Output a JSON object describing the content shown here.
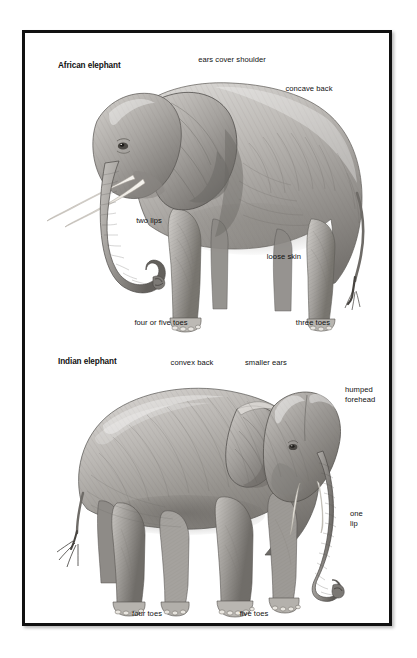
{
  "figure": {
    "kind": "comparative-anatomy-plate",
    "background_color": "#ffffff",
    "frame_color": "#111111",
    "ink_color": "#111111"
  },
  "panels": [
    {
      "id": "african",
      "title": "African elephant",
      "orientation": "facing left, full side profile",
      "labels": [
        {
          "text": "ears cover shoulder",
          "align": "center"
        },
        {
          "text": "concave back",
          "align": "center"
        },
        {
          "text": "two lips",
          "align": "center"
        },
        {
          "text": "loose skin",
          "align": "center"
        },
        {
          "text": "four or five toes",
          "align": "center"
        },
        {
          "text": "three toes",
          "align": "center"
        }
      ]
    },
    {
      "id": "indian",
      "title": "Indian elephant",
      "orientation": "facing right, three-quarter view",
      "labels": [
        {
          "text": "convex back",
          "align": "center"
        },
        {
          "text": "smaller ears",
          "align": "center"
        },
        {
          "text": "humped\nforehead",
          "align": "left"
        },
        {
          "text": "one\nlip",
          "align": "left"
        },
        {
          "text": "four toes",
          "align": "center"
        },
        {
          "text": "five toes",
          "align": "center"
        }
      ]
    }
  ]
}
